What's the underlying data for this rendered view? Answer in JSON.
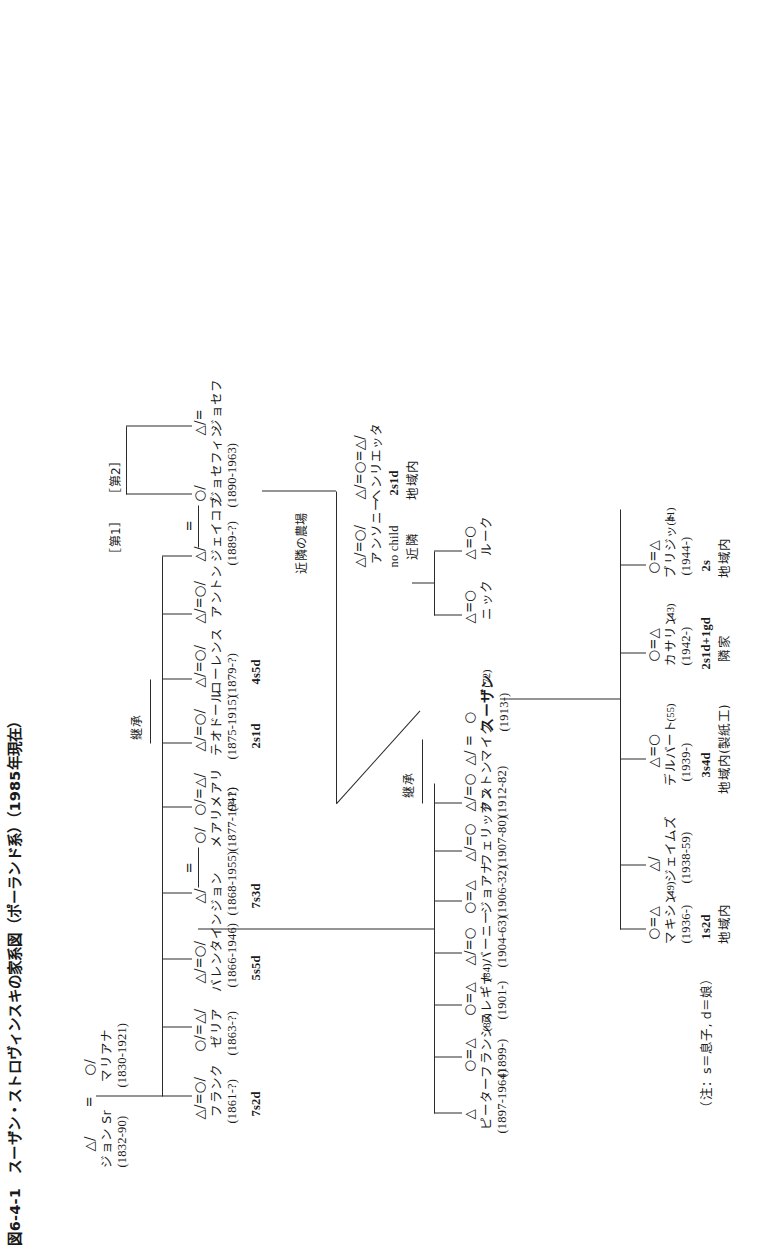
{
  "figure": {
    "number": "図6-4-1",
    "title": "スーザン・ストロヴィンスキの家系図（ポーランド系）（1985年現在）",
    "full_title": "図6-4-1　スーザン・ストロヴィンスキの家系図（ポーランド系）（1985年現在）",
    "note": "（注：s＝息子, d＝娘）"
  },
  "legend": {
    "male_symbol": "△",
    "female_symbol": "○",
    "marriage_symbol": "=",
    "deceased_mark": "/",
    "son_key": "s＝息子",
    "daughter_key": "d＝娘"
  },
  "annotations": {
    "inherit_g2": "継承",
    "inherit_g3": "継承",
    "neighbor_farm": "近隣の農場",
    "no_child": "no child",
    "near_neighbor": "近隣",
    "first_marriage": "［第1］",
    "second_marriage": "［第2］"
  },
  "generations": {
    "g1": {
      "label": "第1世代",
      "persons": [
        {
          "symbols": "△/",
          "name": "ジョン Sr",
          "name_plain": "ジョン",
          "suffix": "Sr",
          "dates": "(1832-90)",
          "bold": false
        },
        {
          "symbols": "○/",
          "name": "マリアナ",
          "dates": "(1830-1921)",
          "bold": false
        }
      ],
      "union": "="
    },
    "g2": {
      "label": "第2世代",
      "persons": [
        {
          "symbols": "△/=○/",
          "name": "フランク",
          "dates": "(1861-?)",
          "children": "7s2d"
        },
        {
          "symbols": "○/=△/",
          "name": "ゼリア",
          "dates": "(1863-?)",
          "children": ""
        },
        {
          "symbols": "△/=○/",
          "name": "バレンタイン",
          "dates": "(1866-1946)",
          "children": "5s5d"
        },
        {
          "symbols": "△/",
          "name": "ジョン",
          "dates": "(1868-1955)",
          "children": "7s3d"
        },
        {
          "symbols": "○/",
          "name": "メアリ",
          "dates": "(1877-1941)",
          "children": ""
        },
        {
          "symbols": "○/=△/",
          "name": "メアリ",
          "dates": "(?-?)",
          "children": ""
        },
        {
          "symbols": "△/=○/",
          "name": "テオドール",
          "dates": "(1875-1915)",
          "children": "2s1d"
        },
        {
          "symbols": "△/=○/",
          "name": "ローレンス",
          "dates": "(1879-?)",
          "children": "4s5d"
        },
        {
          "symbols": "△/=○/",
          "name": "アントン",
          "dates": "",
          "children": ""
        },
        {
          "symbols": "△/",
          "name": "ジェイコブ",
          "dates": "(1889-?)",
          "children": ""
        },
        {
          "symbols": "○/",
          "name": "ジョセフィン",
          "dates": "(1890-1963)",
          "children": ""
        },
        {
          "symbols": "△/=",
          "name": "ジョセフ",
          "dates": "",
          "children": ""
        }
      ],
      "union": "=",
      "inherit": "継承"
    },
    "g3": {
      "label": "第3世代",
      "persons": [
        {
          "symbols": "△",
          "name": "ピーター",
          "dates": "(1897-1964)",
          "age": ""
        },
        {
          "symbols": "○=△",
          "name": "フランシス",
          "age": "(86)",
          "dates": "(1899-)"
        },
        {
          "symbols": "○=△",
          "name": "レギナ",
          "age": "(84)",
          "dates": "(1901-)"
        },
        {
          "symbols": "△/=○",
          "name": "バーニー",
          "dates": "(1904-63)"
        },
        {
          "symbols": "○=△",
          "name": "ジョアナ",
          "dates": "(1906-32)"
        },
        {
          "symbols": "△/=○",
          "name": "フェリックス",
          "dates": "(1907-80)"
        },
        {
          "symbols": "△/=○",
          "name": "アントン",
          "dates": "(1912-82)"
        },
        {
          "symbols": "△/ =",
          "name": "マイク",
          "dates": ""
        },
        {
          "symbols": "○",
          "name": "スーザン",
          "age": "(72)",
          "dates": "(1913-)",
          "bold": true
        }
      ],
      "right_branch": [
        {
          "symbols": "△/=○/",
          "name": "アンソニー",
          "dates": "",
          "note1": "no child",
          "note2": "近隣"
        },
        {
          "symbols": "△/=○=△/",
          "name": "ヘンリエッタ",
          "dates": "",
          "children": "2s1d",
          "residence": "地域内"
        },
        {
          "symbols": "△=○",
          "name": "ニック",
          "dates": ""
        },
        {
          "symbols": "△=○",
          "name": "ルーク",
          "dates": ""
        }
      ]
    },
    "g4": {
      "label": "第4世代",
      "persons": [
        {
          "symbols": "○=△",
          "name": "マキシン",
          "age": "(49)",
          "dates": "(1936-)",
          "children": "1s2d",
          "residence": "地域内"
        },
        {
          "symbols": "△/",
          "name": "ジェイムズ",
          "dates": "(1938-59)",
          "children": "",
          "residence": ""
        },
        {
          "symbols": "△=○",
          "name": "デルバート",
          "age": "(55)",
          "dates": "(1939-)",
          "children": "3s4d",
          "residence": "地域内(製紙工)"
        },
        {
          "symbols": "○=△",
          "name": "カサリン",
          "age": "(43)",
          "dates": "(1942-)",
          "children": "2s1d+1gd",
          "residence": "隣家"
        },
        {
          "symbols": "○=△",
          "name": "ブリジット",
          "age": "(41)",
          "dates": "(1944-)",
          "children": "2s",
          "residence": "地域内"
        }
      ]
    }
  }
}
